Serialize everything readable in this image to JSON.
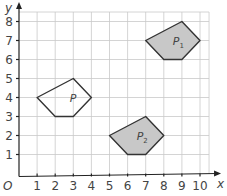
{
  "diagram": {
    "type": "coordinate-grid-transformation",
    "axes": {
      "x_label": "x",
      "y_label": "y",
      "origin_label": "O",
      "x_ticks": [
        "1",
        "2",
        "3",
        "4",
        "5",
        "6",
        "7",
        "8",
        "9",
        "10"
      ],
      "y_ticks": [
        "1",
        "2",
        "3",
        "4",
        "5",
        "6",
        "7",
        "8"
      ],
      "x_range": [
        0,
        10.5
      ],
      "y_range": [
        0,
        8.5
      ]
    },
    "shapes": [
      {
        "name": "P",
        "label": "P",
        "subscript": "",
        "vertices": [
          [
            1,
            4
          ],
          [
            3,
            5
          ],
          [
            4,
            4
          ],
          [
            3,
            3
          ],
          [
            2,
            3
          ]
        ],
        "fill": "none",
        "label_pos": [
          2.8,
          4
        ]
      },
      {
        "name": "P1",
        "label": "P",
        "subscript": "1",
        "vertices": [
          [
            7,
            7
          ],
          [
            9,
            8
          ],
          [
            10,
            7
          ],
          [
            9,
            6
          ],
          [
            8,
            6
          ]
        ],
        "fill": "#c8c8c8",
        "label_pos": [
          8.5,
          7
        ]
      },
      {
        "name": "P2",
        "label": "P",
        "subscript": "2",
        "vertices": [
          [
            5,
            2
          ],
          [
            7,
            3
          ],
          [
            8,
            2
          ],
          [
            7,
            1
          ],
          [
            6,
            1
          ]
        ],
        "fill": "#c8c8c8",
        "label_pos": [
          6.5,
          2
        ]
      }
    ],
    "colors": {
      "grid": "#c9c9c9",
      "axis": "#222222",
      "outline": "#333333",
      "shaded": "#c8c8c8",
      "text": "#444444"
    }
  }
}
